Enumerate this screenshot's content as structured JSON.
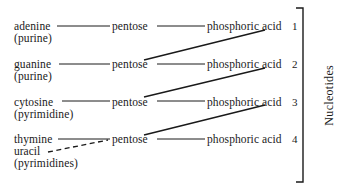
{
  "figure": {
    "caption": "Nucleotides"
  },
  "rows": [
    {
      "base": "adenine",
      "base_sub": "(purine)",
      "base_sub2": "",
      "sugar": "pentose",
      "phosphate": "phosphoric acid",
      "number": "1"
    },
    {
      "base": "guanine",
      "base_sub": "(purine)",
      "base_sub2": "",
      "sugar": "pentose",
      "phosphate": "phosphoric acid",
      "number": "2"
    },
    {
      "base": "cytosine",
      "base_sub": "(pyrimidine)",
      "base_sub2": "",
      "sugar": "pentose",
      "phosphate": "phosphoric acid",
      "number": "3"
    },
    {
      "base": "thymine",
      "base_sub": "uracil",
      "base_sub2": "(pyrimidines)",
      "sugar": "pentose",
      "phosphate": "phosphoric acid",
      "number": "4"
    }
  ],
  "colors": {
    "ink": "#1a1a1a",
    "background": "#ffffff"
  }
}
